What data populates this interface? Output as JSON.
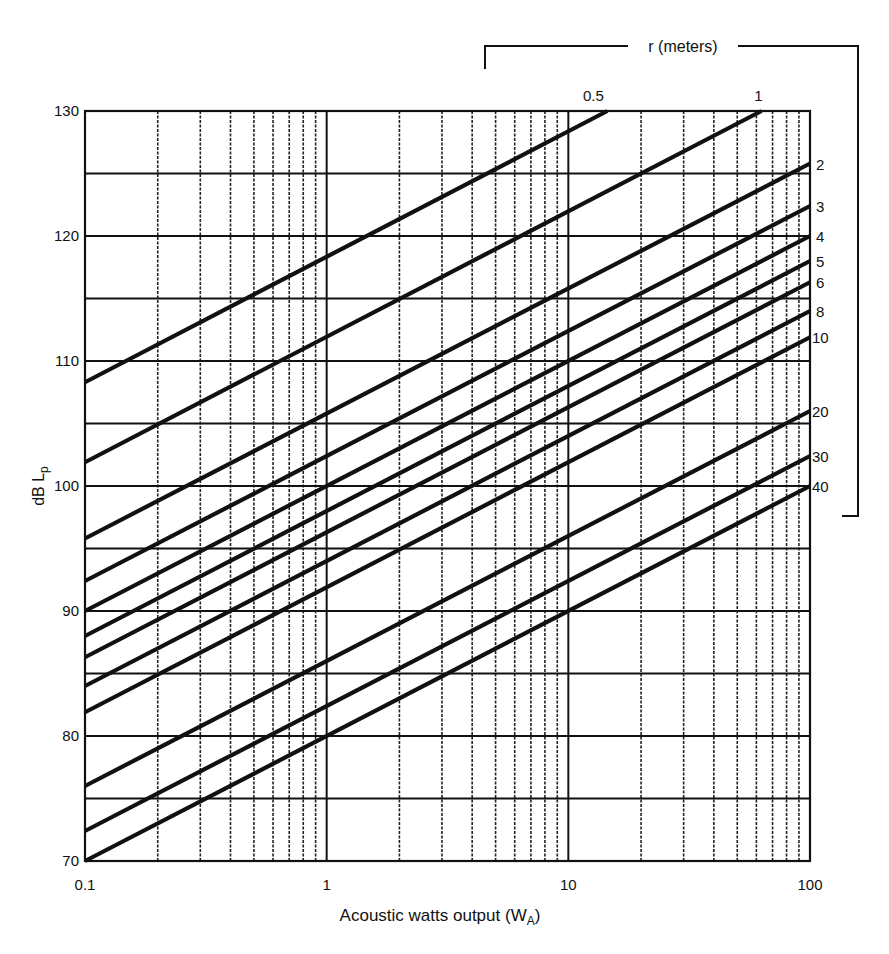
{
  "chart_data": {
    "type": "line",
    "title": "",
    "xlabel": "Acoustic watts output (W_A)",
    "xlabel_main": "Acoustic watts output (W",
    "xlabel_sub": "A",
    "xlabel_close": ")",
    "ylabel": "dB L_p",
    "ylabel_main": "dB L",
    "ylabel_sub": "p",
    "x_scale": "log",
    "xlim": [
      0.1,
      100
    ],
    "ylim": [
      70,
      130
    ],
    "x_ticks": [
      "0.1",
      "1",
      "10",
      "100"
    ],
    "y_ticks": [
      "70",
      "80",
      "90",
      "100",
      "110",
      "120",
      "130"
    ],
    "y_minor_gridlines": [
      75,
      85,
      95,
      105,
      115,
      125
    ],
    "grid": true,
    "legend_title": "r (meters)",
    "legend_position": "line-end labels, right/top",
    "series": [
      {
        "name": "0.5",
        "x": [
          0.1,
          14.5
        ],
        "y": [
          108.3,
          130
        ]
      },
      {
        "name": "1",
        "x": [
          0.1,
          63
        ],
        "y": [
          101.9,
          130
        ]
      },
      {
        "name": "2",
        "x": [
          0.1,
          100
        ],
        "y": [
          95.8,
          125.8
        ]
      },
      {
        "name": "3",
        "x": [
          0.1,
          100
        ],
        "y": [
          92.4,
          122.4
        ]
      },
      {
        "name": "4",
        "x": [
          0.1,
          100
        ],
        "y": [
          90.0,
          120.0
        ]
      },
      {
        "name": "5",
        "x": [
          0.1,
          100
        ],
        "y": [
          88.0,
          118.0
        ]
      },
      {
        "name": "6",
        "x": [
          0.1,
          100
        ],
        "y": [
          86.3,
          116.3
        ]
      },
      {
        "name": "8",
        "x": [
          0.1,
          100
        ],
        "y": [
          84.0,
          114.0
        ]
      },
      {
        "name": "10",
        "x": [
          0.1,
          100
        ],
        "y": [
          81.9,
          111.9
        ]
      },
      {
        "name": "20",
        "x": [
          0.1,
          100
        ],
        "y": [
          76.0,
          106.0
        ]
      },
      {
        "name": "30",
        "x": [
          0.1,
          100
        ],
        "y": [
          72.4,
          102.4
        ]
      },
      {
        "name": "40",
        "x": [
          0.1,
          100
        ],
        "y": [
          70.0,
          100.0
        ]
      }
    ],
    "annotations": [
      "Each line: slope 10 dB per decade of acoustic watts"
    ]
  },
  "caption_partial": "Figure ... Sound pressure level versus acoustic watts output at various distances r"
}
